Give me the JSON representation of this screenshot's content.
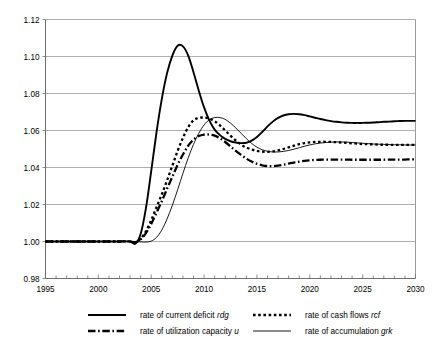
{
  "chart_data": {
    "type": "line",
    "title": "",
    "xlabel": "",
    "ylabel": "",
    "xlim": [
      1995,
      2030
    ],
    "ylim": [
      0.98,
      1.12
    ],
    "ytick_labels": [
      "1.12",
      "1.10",
      "1.08",
      "1.06",
      "1.04",
      "1.02",
      "1.00",
      "0.98"
    ],
    "ytick_values": [
      1.12,
      1.1,
      1.08,
      1.06,
      1.04,
      1.02,
      1.0,
      0.98
    ],
    "xtick_labels": [
      "1995",
      "2000",
      "2005",
      "2010",
      "2015",
      "2020",
      "2025",
      "2030"
    ],
    "xtick_values": [
      1995,
      2000,
      2005,
      2010,
      2015,
      2020,
      2025,
      2030
    ],
    "x_minor_step": 1,
    "grid": "horizontal",
    "legend_position": "bottom",
    "x": [
      1995,
      1996,
      1997,
      1998,
      1999,
      2000,
      2001,
      2002,
      2003,
      2003.5,
      2004,
      2004.5,
      2005,
      2005.5,
      2006,
      2006.5,
      2007,
      2007.5,
      2008,
      2008.5,
      2009,
      2009.5,
      2010,
      2010.5,
      2011,
      2011.5,
      2012,
      2012.5,
      2013,
      2013.5,
      2014,
      2014.5,
      2015,
      2015.5,
      2016,
      2016.5,
      2017,
      2017.5,
      2018,
      2018.5,
      2019,
      2019.5,
      2020,
      2020.5,
      2021,
      2021.5,
      2022,
      2022.5,
      2023,
      2023.5,
      2024,
      2024.5,
      2025,
      2025.5,
      2026,
      2026.5,
      2027,
      2027.5,
      2028,
      2028.5,
      2029,
      2029.5,
      2030
    ],
    "series": [
      {
        "name": "rate of current deficit",
        "symbol": "rdg",
        "style": "solid-thick",
        "color": "#000000",
        "values": [
          1.0,
          1.0,
          1.0,
          1.0,
          1.0,
          1.0,
          1.0,
          1.0,
          1.0,
          0.9988,
          1.004,
          1.018,
          1.038,
          1.059,
          1.077,
          1.091,
          1.1005,
          1.1058,
          1.1055,
          1.1005,
          1.0915,
          1.0815,
          1.0725,
          1.0655,
          1.0605,
          1.0575,
          1.0555,
          1.0542,
          1.0535,
          1.0532,
          1.0534,
          1.0545,
          1.0565,
          1.0592,
          1.0622,
          1.0648,
          1.0668,
          1.0681,
          1.0688,
          1.069,
          1.0688,
          1.0683,
          1.0676,
          1.0669,
          1.0662,
          1.0656,
          1.0651,
          1.0647,
          1.0644,
          1.0642,
          1.0641,
          1.0641,
          1.0641,
          1.0642,
          1.0643,
          1.0645,
          1.0647,
          1.0648,
          1.065,
          1.0651,
          1.0652,
          1.0652,
          1.0652
        ]
      },
      {
        "name": "rate of cash flows",
        "symbol": "rcf",
        "style": "dotted-thick",
        "color": "#000000",
        "values": [
          1.0,
          1.0,
          1.0,
          1.0,
          1.0,
          1.0,
          1.0,
          1.0,
          1.0,
          0.9995,
          1.0015,
          1.0055,
          1.0115,
          1.0185,
          1.0255,
          1.033,
          1.041,
          1.049,
          1.056,
          1.0618,
          1.0655,
          1.0668,
          1.067,
          1.0664,
          1.065,
          1.0628,
          1.06,
          1.0572,
          1.0546,
          1.0524,
          1.0508,
          1.0497,
          1.049,
          1.0486,
          1.0485,
          1.0487,
          1.0492,
          1.05,
          1.0509,
          1.0518,
          1.0526,
          1.0532,
          1.0536,
          1.0538,
          1.0539,
          1.0539,
          1.0538,
          1.0537,
          1.0535,
          1.0533,
          1.0531,
          1.0529,
          1.0527,
          1.0526,
          1.0525,
          1.0524,
          1.0523,
          1.0523,
          1.0522,
          1.0522,
          1.0522,
          1.0522,
          1.0522
        ]
      },
      {
        "name": "rate of utilization capacity",
        "symbol": "u",
        "style": "dashdot-thick",
        "color": "#000000",
        "values": [
          1.0,
          1.0,
          1.0,
          1.0,
          1.0,
          1.0,
          1.0,
          1.0,
          1.0,
          0.9996,
          1.0012,
          1.0045,
          1.0095,
          1.0155,
          1.0218,
          1.0285,
          1.035,
          1.0415,
          1.047,
          1.0518,
          1.055,
          1.057,
          1.0578,
          1.0578,
          1.0572,
          1.0558,
          1.0538,
          1.0514,
          1.049,
          1.0468,
          1.0448,
          1.0432,
          1.042,
          1.0412,
          1.0408,
          1.0407,
          1.041,
          1.0415,
          1.0421,
          1.0427,
          1.0432,
          1.0436,
          1.0439,
          1.0441,
          1.0442,
          1.0443,
          1.0443,
          1.0443,
          1.0443,
          1.0443,
          1.0442,
          1.0442,
          1.0442,
          1.0442,
          1.0442,
          1.0442,
          1.0442,
          1.0443,
          1.0443,
          1.0443,
          1.0443,
          1.0444,
          1.0444
        ]
      },
      {
        "name": "rate of accumulation",
        "symbol": "grk",
        "style": "solid-thin",
        "color": "#000000",
        "values": [
          1.0,
          1.0,
          1.0,
          1.0,
          1.0,
          1.0,
          1.0,
          1.0,
          1.0,
          1.0,
          0.9998,
          0.9997,
          1.0002,
          1.0022,
          1.0062,
          1.0122,
          1.0196,
          1.028,
          1.0368,
          1.0452,
          1.0525,
          1.0585,
          1.063,
          1.0658,
          1.067,
          1.067,
          1.066,
          1.064,
          1.0614,
          1.0585,
          1.0556,
          1.053,
          1.051,
          1.0496,
          1.0488,
          1.0484,
          1.0484,
          1.0487,
          1.0492,
          1.0499,
          1.0507,
          1.0515,
          1.0522,
          1.0528,
          1.0532,
          1.0535,
          1.0537,
          1.0538,
          1.0538,
          1.0537,
          1.0535,
          1.0533,
          1.0531,
          1.0529,
          1.0527,
          1.0526,
          1.0525,
          1.0524,
          1.0523,
          1.0523,
          1.0522,
          1.0522,
          1.0522
        ]
      }
    ],
    "legend_entries": [
      {
        "label": "rate of current deficit",
        "symbol": "rdg",
        "style": "solid-thick"
      },
      {
        "label": "rate of cash flows",
        "symbol": "rcf",
        "style": "dotted-thick"
      },
      {
        "label": "rate of utilization capacity",
        "symbol": "u",
        "style": "dashdot-thick"
      },
      {
        "label": "rate of accumulation",
        "symbol": "grk",
        "style": "solid-thin"
      }
    ],
    "colors": {
      "grid": "#9a9a9a",
      "axis": "#6f6f6f",
      "series": "#000000",
      "background": "#ffffff"
    }
  }
}
